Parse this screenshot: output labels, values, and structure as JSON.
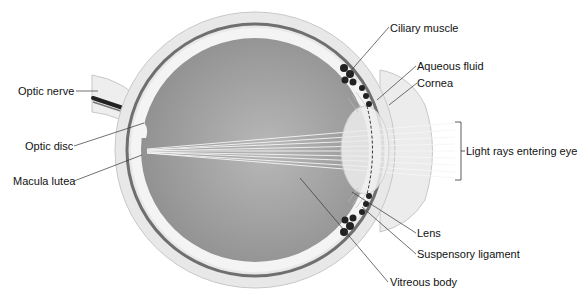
{
  "diagram": {
    "labels": {
      "optic_nerve": "Optic nerve",
      "optic_disc": "Optic disc",
      "macula_lutea": "Macula lutea",
      "ciliary_muscle": "Ciliary muscle",
      "aqueous_fluid": "Aqueous fluid",
      "cornea": "Cornea",
      "light_rays": "Light rays entering eye",
      "lens": "Lens",
      "suspensory_ligament": "Suspensory ligament",
      "vitreous_body": "Vitreous body"
    },
    "colors": {
      "background": "#ffffff",
      "sclera": "#e6e6e6",
      "choroid": "#6f6f6f",
      "vitreous": "#9a9a9a",
      "lens": "#eeeeee",
      "muscle": "#222222",
      "leader_line": "#333333"
    }
  }
}
